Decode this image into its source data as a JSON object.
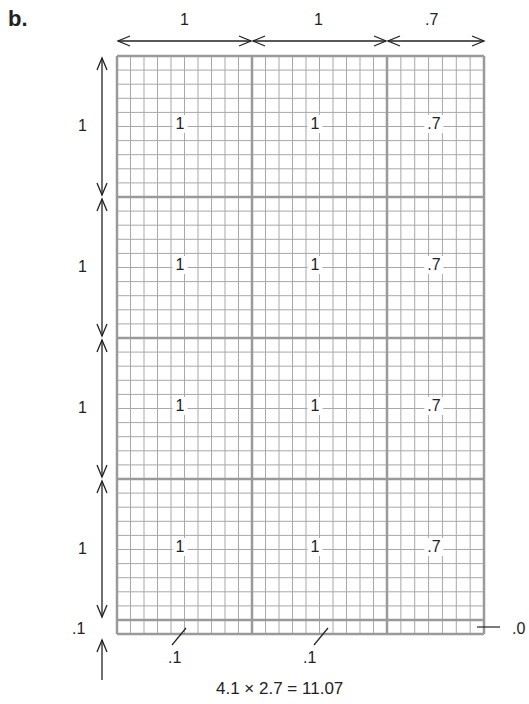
{
  "part_label": "b.",
  "top_dimensions": [
    "1",
    "1",
    ".7"
  ],
  "side_dimensions": [
    "1",
    "1",
    "1",
    "1",
    ".1"
  ],
  "cell_labels": [
    [
      "1",
      "1",
      ".7"
    ],
    [
      "1",
      "1",
      ".7"
    ],
    [
      "1",
      "1",
      ".7"
    ],
    [
      "1",
      "1",
      ".7"
    ]
  ],
  "bottom_strip_labels": [
    ".1",
    ".1"
  ],
  "corner_label": ".0",
  "equation": "4.1 × 2.7 = 11.07",
  "grid": {
    "columns_units": [
      1,
      1,
      0.7
    ],
    "rows_units": [
      1,
      1,
      1,
      1,
      0.1
    ],
    "subdivisions_per_unit": 10,
    "line_color": "#a8a8a8",
    "major_line_color": "#9a9a9a"
  }
}
